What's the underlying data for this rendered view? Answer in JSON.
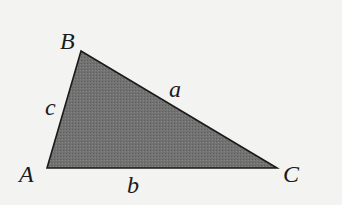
{
  "diagram": {
    "type": "triangle",
    "colors": {
      "background": "#f3f3f1",
      "fill": "#6f6f6f",
      "stroke": "#1a1a1a",
      "text": "#1a1a1a"
    },
    "vertices": [
      {
        "name": "A",
        "x": 47,
        "y": 168,
        "label": "A",
        "label_x": 19,
        "label_y": 182
      },
      {
        "name": "B",
        "x": 81,
        "y": 51,
        "label": "B",
        "label_x": 60,
        "label_y": 49
      },
      {
        "name": "C",
        "x": 277,
        "y": 168,
        "label": "C",
        "label_x": 283,
        "label_y": 182
      }
    ],
    "sides": [
      {
        "name": "a",
        "label": "a",
        "between": "B-C",
        "label_x": 169,
        "label_y": 97
      },
      {
        "name": "b",
        "label": "b",
        "between": "A-C",
        "label_x": 127,
        "label_y": 193
      },
      {
        "name": "c",
        "label": "c",
        "between": "A-B",
        "label_x": 45,
        "label_y": 115
      }
    ]
  }
}
